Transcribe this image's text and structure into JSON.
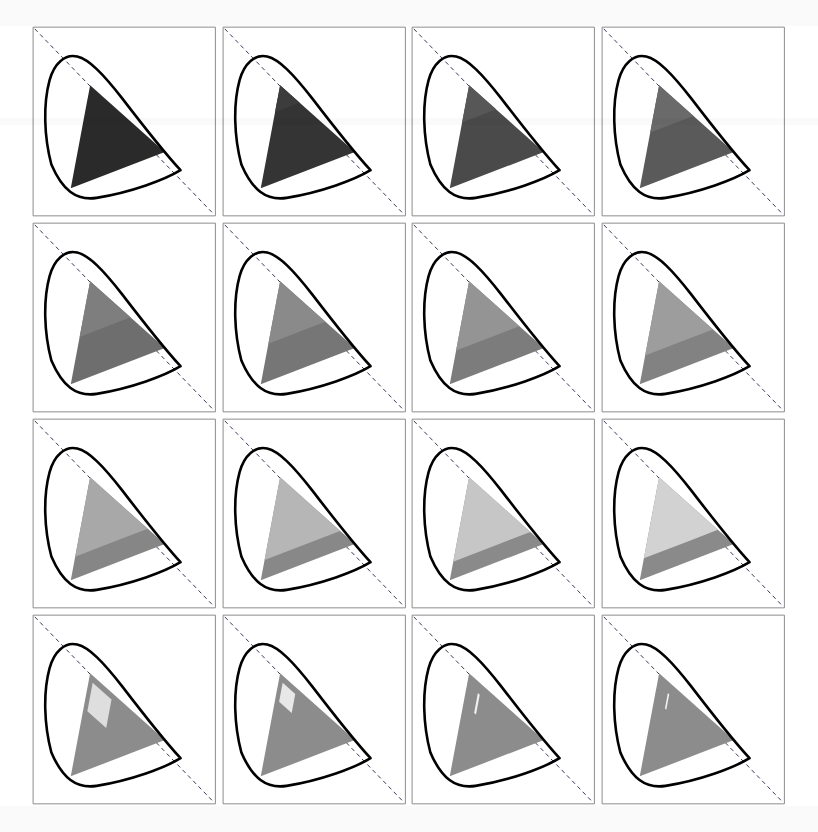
{
  "figure": {
    "kind": "chromaticity-diagram-grid",
    "rows": 4,
    "columns": 4,
    "panel_count": 16,
    "background_color": "#ffffff",
    "frame_color": "#808080",
    "locus_color": "#000000",
    "diagonal_color": "#3a3a5a",
    "diagonal_style": "dashed"
  },
  "chart_data": {
    "type": "scatter",
    "title": "",
    "subtitle": "",
    "xlabel": "",
    "ylabel": "",
    "xlim": [
      0,
      1
    ],
    "ylim": [
      0,
      1
    ],
    "grid": false,
    "legend": null,
    "series": [
      {
        "name": "spectral-locus",
        "description": "CIE horseshoe outline, drawn as thick black closed curve in every panel"
      },
      {
        "name": "line-of-purples-diagonal",
        "description": "dashed straight line from top-left corner to bottom-right corner"
      },
      {
        "name": "gamut-triangle",
        "description": "filled triangle whose fill lightens monotonically across the 16 panels"
      },
      {
        "name": "inner-subregion",
        "description": "lighter sub-polygon inside the gamut triangle that grows then collapses to a sliver"
      }
    ],
    "panels": [
      {
        "index": 1,
        "row": 1,
        "col": 1,
        "triangle_gray": "#2a2a2a",
        "inner_gray": "#2a2a2a",
        "inner_scale": 0.0,
        "inner_kind": "none"
      },
      {
        "index": 2,
        "row": 1,
        "col": 2,
        "triangle_gray": "#343434",
        "inner_gray": "#3c3c3c",
        "inner_scale": 0.1,
        "inner_kind": "wedge"
      },
      {
        "index": 3,
        "row": 1,
        "col": 3,
        "triangle_gray": "#4a4a4a",
        "inner_gray": "#575757",
        "inner_scale": 0.22,
        "inner_kind": "wedge"
      },
      {
        "index": 4,
        "row": 1,
        "col": 4,
        "triangle_gray": "#5a5a5a",
        "inner_gray": "#6a6a6a",
        "inner_scale": 0.34,
        "inner_kind": "wedge"
      },
      {
        "index": 5,
        "row": 2,
        "col": 1,
        "triangle_gray": "#6e6e6e",
        "inner_gray": "#7e7e7e",
        "inner_scale": 0.44,
        "inner_kind": "wedge"
      },
      {
        "index": 6,
        "row": 2,
        "col": 2,
        "triangle_gray": "#767676",
        "inner_gray": "#8a8a8a",
        "inner_scale": 0.52,
        "inner_kind": "wedge"
      },
      {
        "index": 7,
        "row": 2,
        "col": 3,
        "triangle_gray": "#7c7c7c",
        "inner_gray": "#949494",
        "inner_scale": 0.6,
        "inner_kind": "wedge"
      },
      {
        "index": 8,
        "row": 2,
        "col": 4,
        "triangle_gray": "#828282",
        "inner_gray": "#9d9d9d",
        "inner_scale": 0.66,
        "inner_kind": "wedge"
      },
      {
        "index": 9,
        "row": 3,
        "col": 1,
        "triangle_gray": "#868686",
        "inner_gray": "#a8a8a8",
        "inner_scale": 0.72,
        "inner_kind": "wedge"
      },
      {
        "index": 10,
        "row": 3,
        "col": 2,
        "triangle_gray": "#888888",
        "inner_gray": "#b6b6b6",
        "inner_scale": 0.76,
        "inner_kind": "wedge"
      },
      {
        "index": 11,
        "row": 3,
        "col": 3,
        "triangle_gray": "#8a8a8a",
        "inner_gray": "#c6c6c6",
        "inner_scale": 0.78,
        "inner_kind": "wedge"
      },
      {
        "index": 12,
        "row": 3,
        "col": 4,
        "triangle_gray": "#8a8a8a",
        "inner_gray": "#d2d2d2",
        "inner_scale": 0.74,
        "inner_kind": "wedge"
      },
      {
        "index": 13,
        "row": 4,
        "col": 1,
        "triangle_gray": "#8c8c8c",
        "inner_gray": "#dedede",
        "inner_scale": 0.6,
        "inner_kind": "patch"
      },
      {
        "index": 14,
        "row": 4,
        "col": 2,
        "triangle_gray": "#8c8c8c",
        "inner_gray": "#e8e8e8",
        "inner_scale": 0.4,
        "inner_kind": "patch"
      },
      {
        "index": 15,
        "row": 4,
        "col": 3,
        "triangle_gray": "#8c8c8c",
        "inner_gray": "#f0f0f0",
        "inner_scale": 0.24,
        "inner_kind": "sliver"
      },
      {
        "index": 16,
        "row": 4,
        "col": 4,
        "triangle_gray": "#8c8c8c",
        "inner_gray": "#f6f6f6",
        "inner_scale": 0.1,
        "inner_kind": "sliver"
      }
    ]
  }
}
